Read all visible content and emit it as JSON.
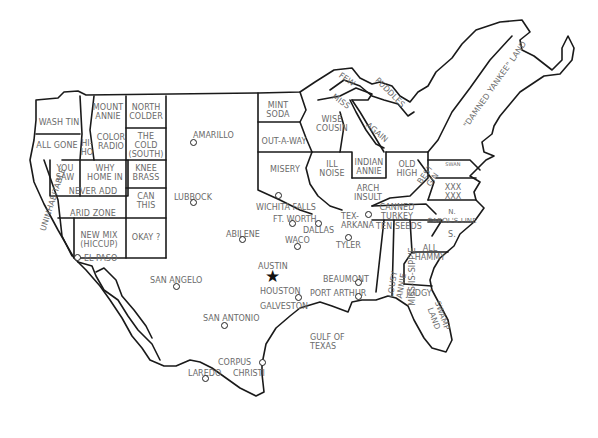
{
  "map": {
    "title_visible": false,
    "colors": {
      "outline": "#1a1a1a",
      "label": "#6a6a6a",
      "background": "#ffffff"
    },
    "regions": [
      {
        "id": "wa",
        "label": "WASH TIN",
        "x": 38,
        "y": 118,
        "w": 42
      },
      {
        "id": "or",
        "label": "ALL GONE",
        "x": 34,
        "y": 141,
        "w": 46
      },
      {
        "id": "id",
        "label": "HI-\nHO",
        "x": 80,
        "y": 139,
        "w": 14
      },
      {
        "id": "mt",
        "label": "MOUNT\nANNIE",
        "x": 90,
        "y": 103,
        "w": 36
      },
      {
        "id": "nd",
        "label": "NORTH\nCOLDER",
        "x": 128,
        "y": 103,
        "w": 36
      },
      {
        "id": "wy",
        "label": "COLOR\nRADIO",
        "x": 94,
        "y": 133,
        "w": 34
      },
      {
        "id": "sd",
        "label": "THE\nCOLD\n(SOUTH)",
        "x": 128,
        "y": 132,
        "w": 36
      },
      {
        "id": "nv",
        "label": "YOU\nSAW",
        "x": 50,
        "y": 164,
        "w": 30
      },
      {
        "id": "ut",
        "label": "WHY\nHOME IN",
        "x": 82,
        "y": 164,
        "w": 46
      },
      {
        "id": "ne",
        "label": "KNEE\nBRASS",
        "x": 128,
        "y": 164,
        "w": 36
      },
      {
        "id": "co",
        "label": "NEVER ADD",
        "x": 58,
        "y": 187,
        "w": 70
      },
      {
        "id": "ks",
        "label": "CAN\nTHIS",
        "x": 128,
        "y": 192,
        "w": 36
      },
      {
        "id": "az",
        "label": "ARID ZONE",
        "x": 58,
        "y": 209,
        "w": 70
      },
      {
        "id": "nm",
        "label": "NEW MIX\n(HICCUP)",
        "x": 74,
        "y": 231,
        "w": 50
      },
      {
        "id": "ok",
        "label": "OKAY ?",
        "x": 126,
        "y": 233,
        "w": 40
      },
      {
        "id": "ca",
        "label": "UNINHABITABLE",
        "x": 18,
        "y": 195,
        "w": 70,
        "rotate": -72
      },
      {
        "id": "mn",
        "label": "MINT\nSODA",
        "x": 258,
        "y": 101,
        "w": 40
      },
      {
        "id": "ia",
        "label": "OUT-A-WAY",
        "x": 256,
        "y": 137,
        "w": 56
      },
      {
        "id": "mo",
        "label": "MISERY",
        "x": 262,
        "y": 165,
        "w": 46
      },
      {
        "id": "wi",
        "label": "WISE\nCOUSIN",
        "x": 312,
        "y": 115,
        "w": 40
      },
      {
        "id": "il",
        "label": "ILL\nNOISE",
        "x": 314,
        "y": 160,
        "w": 36
      },
      {
        "id": "in",
        "label": "INDIAN\nANNIE",
        "x": 352,
        "y": 158,
        "w": 34
      },
      {
        "id": "mi",
        "label": "AGAIN",
        "x": 360,
        "y": 128,
        "w": 34,
        "rotate": 40
      },
      {
        "id": "su",
        "label": "FEW",
        "x": 336,
        "y": 75,
        "w": 22,
        "rotate": 35
      },
      {
        "id": "ms_lake",
        "label": "MISS",
        "x": 330,
        "y": 97,
        "w": 22,
        "rotate": 35
      },
      {
        "id": "pu",
        "label": "PUDDLES",
        "x": 368,
        "y": 88,
        "w": 44,
        "rotate": 45
      },
      {
        "id": "oh",
        "label": "OLD\nHIGH",
        "x": 390,
        "y": 160,
        "w": 34
      },
      {
        "id": "ky",
        "label": "ARCH\nINSULT",
        "x": 348,
        "y": 184,
        "w": 40
      },
      {
        "id": "tn",
        "label": "CANNED\nTURKEY",
        "x": 372,
        "y": 203,
        "w": 50
      },
      {
        "id": "wv",
        "label": "BEST\nGIN",
        "x": 418,
        "y": 168,
        "w": 22,
        "rotate": -55
      },
      {
        "id": "md",
        "label": "SWAN",
        "x": 442,
        "y": 160,
        "w": 22,
        "size": 5
      },
      {
        "id": "va",
        "label": "XXX\nXXX",
        "x": 438,
        "y": 183,
        "w": 30
      },
      {
        "id": "nc",
        "label": "N.\nCAROL'S LINE",
        "x": 426,
        "y": 208,
        "w": 52,
        "size": 7
      },
      {
        "id": "sc",
        "label": "S.",
        "x": 442,
        "y": 230,
        "w": 20
      },
      {
        "id": "ar",
        "label": "TEN SEEDS",
        "x": 374,
        "y": 222,
        "w": 50
      },
      {
        "id": "ga",
        "label": "ALL\nHAMMY",
        "x": 408,
        "y": 244,
        "w": 44
      },
      {
        "id": "la",
        "label": "LOUSY ANNIE",
        "x": 370,
        "y": 276,
        "w": 54,
        "rotate": -80
      },
      {
        "id": "ms",
        "label": "MISS-IS-SIPPIE",
        "x": 382,
        "y": 272,
        "w": 60,
        "rotate": -90
      },
      {
        "id": "al",
        "label": "JUDGY",
        "x": 403,
        "y": 289,
        "w": 32
      },
      {
        "id": "fl",
        "label": "SWAMP\nLAND",
        "x": 420,
        "y": 308,
        "w": 36,
        "rotate": 70
      },
      {
        "id": "ne_big",
        "label": "\"DAMNED YANKEE\" LAND",
        "x": 430,
        "y": 80,
        "w": 130,
        "rotate": -55
      }
    ],
    "cities": [
      {
        "name": "AMARILLO",
        "lx": 193,
        "ly": 131,
        "dx": 193,
        "dy": 142
      },
      {
        "name": "LUBBOCK",
        "lx": 174,
        "ly": 193,
        "dx": 193,
        "dy": 202
      },
      {
        "name": "WICHITA FALLS",
        "lx": 256,
        "ly": 203,
        "dx": 278,
        "dy": 195
      },
      {
        "name": "FT. WORTH",
        "lx": 273,
        "ly": 215,
        "dx": 292,
        "dy": 223
      },
      {
        "name": "DALLAS",
        "lx": 303,
        "ly": 226,
        "dx": 318,
        "dy": 223
      },
      {
        "name": "ABILENE",
        "lx": 226,
        "ly": 230,
        "dx": 242,
        "dy": 239
      },
      {
        "name": "WACO",
        "lx": 285,
        "ly": 236,
        "dx": 297,
        "dy": 246
      },
      {
        "name": "TEX-\nARKANA",
        "lx": 341,
        "ly": 212,
        "dx": 368,
        "dy": 214
      },
      {
        "name": "TYLER",
        "lx": 336,
        "ly": 241,
        "dx": 348,
        "dy": 237
      },
      {
        "name": "EL PASO",
        "lx": 84,
        "ly": 254,
        "dx": 77,
        "dy": 257
      },
      {
        "name": "SAN ANGELO",
        "lx": 150,
        "ly": 276,
        "dx": 176,
        "dy": 286
      },
      {
        "name": "AUSTIN",
        "lx": 258,
        "ly": 262,
        "star": true,
        "sx": 265,
        "sy": 268
      },
      {
        "name": "HOUSTON",
        "lx": 260,
        "ly": 287,
        "dx": 298,
        "dy": 297
      },
      {
        "name": "GALVESTON",
        "lx": 260,
        "ly": 302,
        "dx": null,
        "dy": null
      },
      {
        "name": "BEAUMONT",
        "lx": 323,
        "ly": 275,
        "dx": 358,
        "dy": 282
      },
      {
        "name": "PORT ARTHUR",
        "lx": 310,
        "ly": 289,
        "dx": 358,
        "dy": 296
      },
      {
        "name": "SAN ANTONIO",
        "lx": 203,
        "ly": 314,
        "dx": 224,
        "dy": 325
      },
      {
        "name": "GULF OF\nTEXAS",
        "lx": 310,
        "ly": 333,
        "dx": null,
        "dy": null
      },
      {
        "name": "CORPUS",
        "lx": 218,
        "ly": 358,
        "dx": 262,
        "dy": 362
      },
      {
        "name": "CHRISTI",
        "lx": 233,
        "ly": 369,
        "dx": null,
        "dy": null
      },
      {
        "name": "LAREDO",
        "lx": 188,
        "ly": 369,
        "dx": 205,
        "dy": 378
      }
    ]
  }
}
